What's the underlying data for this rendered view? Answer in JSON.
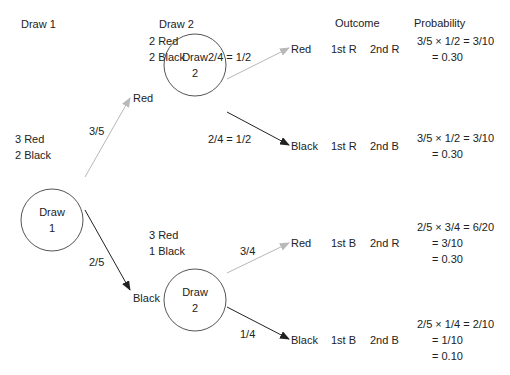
{
  "headers": {
    "draw1": "Draw 1",
    "draw2": "Draw 2",
    "outcome": "Outcome",
    "probability": "Probability"
  },
  "draw1": {
    "node_line1": "Draw",
    "node_line2": "1",
    "contents": [
      "3 Red",
      "2 Black"
    ],
    "branches": [
      {
        "prob": "3/5",
        "result": "Red",
        "color": "#b8b8b8"
      },
      {
        "prob": "2/5",
        "result": "Black",
        "color": "#222222"
      }
    ]
  },
  "draw2_top": {
    "node_line1": "Draw",
    "node_line2": "2",
    "contents": [
      "2 Red",
      "2 Black"
    ],
    "branches": [
      {
        "prob": "2/4 = 1/2",
        "result": "Red",
        "first": "1st R",
        "second": "2nd R",
        "probability": [
          "3/5 × 1/2 = 3/10",
          "= 0.30"
        ],
        "color": "#b8b8b8"
      },
      {
        "prob": "2/4 = 1/2",
        "result": "Black",
        "first": "1st R",
        "second": "2nd B",
        "probability": [
          "3/5 × 1/2 = 3/10",
          "= 0.30"
        ],
        "color": "#222222"
      }
    ]
  },
  "draw2_bottom": {
    "node_line1": "Draw",
    "node_line2": "2",
    "contents": [
      "3 Red",
      "1 Black"
    ],
    "branches": [
      {
        "prob": "3/4",
        "result": "Red",
        "first": "1st B",
        "second": "2nd R",
        "probability": [
          "2/5 × 3/4 = 6/20",
          "= 3/10",
          "= 0.30"
        ],
        "color": "#b8b8b8"
      },
      {
        "prob": "1/4",
        "result": "Black",
        "first": "1st B",
        "second": "2nd B",
        "probability": [
          "2/5 × 1/4 = 2/10",
          "= 1/10",
          "= 0.10"
        ],
        "color": "#222222"
      }
    ]
  }
}
